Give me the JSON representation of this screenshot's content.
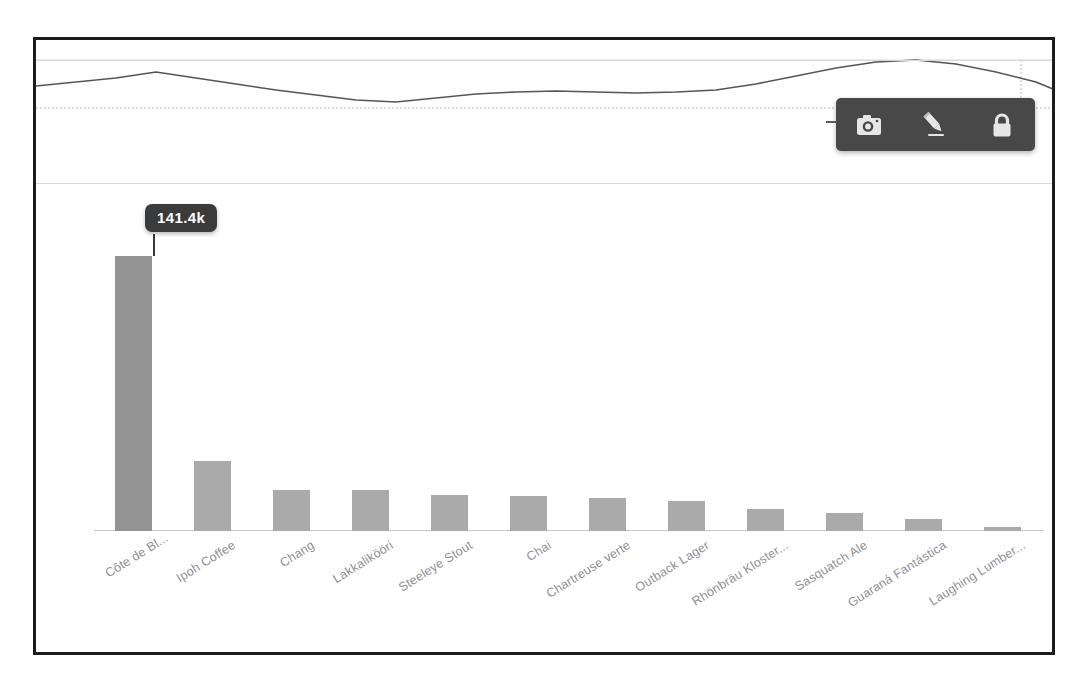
{
  "chart_data": {
    "type": "bar",
    "title": "",
    "xlabel": "",
    "ylabel": "",
    "grid": true,
    "legend": "none",
    "categories": [
      "Côte de Bl...",
      "Ipoh Coffee",
      "Chang",
      "Lakkalikööri",
      "Steeleye Stout",
      "Chai",
      "Chartreuse verte",
      "Outback Lager",
      "Rhönbräu Kloster...",
      "Sasquatch Ale",
      "Guaraná Fantástica",
      "Laughing Lumber..."
    ],
    "values": [
      141400,
      36000,
      21000,
      21000,
      18500,
      18000,
      17000,
      15500,
      11500,
      9500,
      6000,
      2300
    ],
    "value_labels": [
      "141.4k",
      "",
      "",
      "",
      "",
      "",
      "",
      "",
      "",
      "",
      "",
      ""
    ],
    "ylim": [
      0,
      170000
    ],
    "highlighted_index": 0,
    "tooltip": {
      "value": "141.4k",
      "index": 0
    },
    "bar_color": "#aaaaaa",
    "bar_color_highlight": "#939393",
    "gridline_color": "#d8d8dc",
    "axis_label_color": "#8f8f95"
  },
  "sparkline": {
    "type": "line",
    "label": "overview-range-selector",
    "line_color": "#555555",
    "baseline_color": "#bfbfbf",
    "selection_edge_color": "#b9b9b9",
    "points": [
      [
        0,
        46
      ],
      [
        40,
        42
      ],
      [
        80,
        38
      ],
      [
        120,
        32
      ],
      [
        160,
        38
      ],
      [
        200,
        44
      ],
      [
        240,
        50
      ],
      [
        280,
        55
      ],
      [
        320,
        60
      ],
      [
        360,
        62
      ],
      [
        400,
        58
      ],
      [
        440,
        54
      ],
      [
        480,
        52
      ],
      [
        520,
        51
      ],
      [
        560,
        52
      ],
      [
        600,
        53
      ],
      [
        640,
        52
      ],
      [
        680,
        50
      ],
      [
        720,
        44
      ],
      [
        760,
        36
      ],
      [
        800,
        28
      ],
      [
        840,
        22
      ],
      [
        880,
        20
      ],
      [
        920,
        24
      ],
      [
        960,
        32
      ],
      [
        1000,
        42
      ],
      [
        1019,
        50
      ]
    ]
  },
  "toolbar": {
    "name": "floating-chart-toolbar",
    "background": "#484848",
    "buttons": [
      {
        "name": "camera-icon",
        "label": "Snapshot"
      },
      {
        "name": "pencil-icon",
        "label": "Annotate"
      },
      {
        "name": "lock-icon",
        "label": "Lock"
      }
    ]
  },
  "frame": {
    "border_color": "#1c1c1c",
    "background": "#ffffff"
  }
}
